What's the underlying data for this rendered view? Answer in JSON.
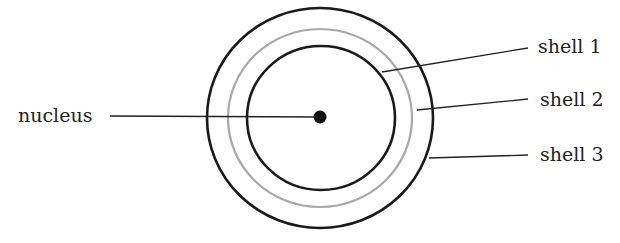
{
  "diagram": {
    "labels": {
      "nucleus": "nucleus",
      "shell1": "shell 1",
      "shell2": "shell 2",
      "shell3": "shell 3"
    },
    "colors": {
      "dark_line": "#1a1a1a",
      "gray_shell": "#a8a8a8",
      "text": "#222222"
    }
  }
}
